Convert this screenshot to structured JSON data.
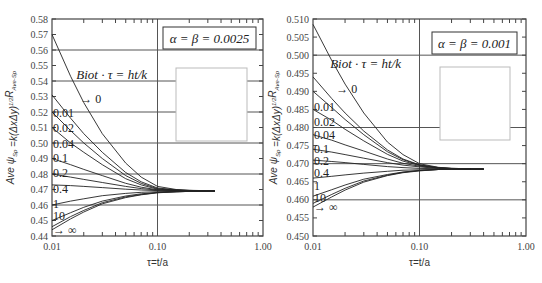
{
  "chart_data": [
    {
      "type": "line",
      "id": "left",
      "annotation_box": "α = β = 0.0025",
      "legend_title": "Biot·τ = ht/k",
      "xlabel": "τ=t/a",
      "ylabel": "Ave ψSp=k(ΔxΔy)^1/2 RAve-Sp",
      "xscale": "log",
      "xlim": [
        0.01,
        1.0
      ],
      "ylim": [
        0.44,
        0.58
      ],
      "xticks": [
        "0.01",
        "0.10",
        "1.00"
      ],
      "yticks": [
        "0.44",
        "0.45",
        "0.46",
        "0.47",
        "0.48",
        "0.49",
        "0.50",
        "0.51",
        "0.52",
        "0.53",
        "0.54",
        "0.55",
        "0.56",
        "0.57",
        "0.58"
      ],
      "grid_y": [
        0.46,
        0.48,
        0.5,
        0.52,
        0.54,
        0.56
      ],
      "grid_x": [
        0.1
      ],
      "converge_value": 0.469,
      "x": [
        0.01,
        0.015,
        0.02,
        0.03,
        0.05,
        0.07,
        0.1,
        0.15,
        0.2,
        0.3,
        0.35
      ],
      "series": [
        {
          "name": "0",
          "label": "→ 0",
          "values": [
            0.57,
            0.543,
            0.526,
            0.506,
            0.487,
            0.478,
            0.472,
            0.47,
            0.4695,
            0.4692,
            0.469
          ]
        },
        {
          "name": "0.01",
          "label": "0.01",
          "values": [
            0.531,
            0.516,
            0.506,
            0.494,
            0.481,
            0.475,
            0.471,
            0.4698,
            0.4694,
            0.4691,
            0.469
          ]
        },
        {
          "name": "0.02",
          "label": "0.02",
          "values": [
            0.52,
            0.508,
            0.5,
            0.49,
            0.479,
            0.474,
            0.4705,
            0.4696,
            0.4693,
            0.4691,
            0.469
          ]
        },
        {
          "name": "0.04",
          "label": "0.04",
          "values": [
            0.51,
            0.5,
            0.494,
            0.486,
            0.477,
            0.473,
            0.4702,
            0.4695,
            0.4692,
            0.4691,
            0.469
          ]
        },
        {
          "name": "0.1",
          "label": "0.1",
          "values": [
            0.49,
            0.486,
            0.483,
            0.479,
            0.474,
            0.4715,
            0.4698,
            0.4694,
            0.4692,
            0.469,
            0.469
          ]
        },
        {
          "name": "0.2",
          "label": "0.2",
          "values": [
            0.48,
            0.478,
            0.4765,
            0.4745,
            0.472,
            0.4706,
            0.4696,
            0.4693,
            0.4691,
            0.469,
            0.469
          ]
        },
        {
          "name": "0.4",
          "label": "0.4",
          "values": [
            0.473,
            0.4725,
            0.472,
            0.4712,
            0.4702,
            0.4697,
            0.4693,
            0.4691,
            0.469,
            0.469,
            0.469
          ]
        },
        {
          "name": "1",
          "label": "1",
          "values": [
            0.46,
            0.4625,
            0.464,
            0.466,
            0.4675,
            0.4682,
            0.4686,
            0.4688,
            0.4689,
            0.469,
            0.469
          ]
        },
        {
          "name": "10",
          "label": "10",
          "values": [
            0.45,
            0.455,
            0.4585,
            0.4625,
            0.4658,
            0.4672,
            0.4681,
            0.4686,
            0.4688,
            0.4689,
            0.469
          ]
        },
        {
          "name": "inf",
          "label": "→ ∞",
          "values": [
            0.446,
            0.4525,
            0.4565,
            0.4615,
            0.4652,
            0.4668,
            0.468,
            0.4685,
            0.4688,
            0.4689,
            0.469
          ]
        },
        {
          "name": "inf2",
          "label": "",
          "values": [
            0.444,
            0.451,
            0.4555,
            0.4608,
            0.4648,
            0.4666,
            0.4679,
            0.4685,
            0.4688,
            0.4689,
            0.469
          ]
        }
      ],
      "curve_labels": [
        {
          "text": "Biot · τ = ht/k",
          "x": 0.017,
          "y": 0.541,
          "italic": true
        },
        {
          "text": "→ 0",
          "x": 0.0185,
          "y": 0.526
        },
        {
          "text": "0.01",
          "x": 0.0102,
          "y": 0.517
        },
        {
          "text": "0.02",
          "x": 0.0102,
          "y": 0.507
        },
        {
          "text": "0.04",
          "x": 0.0102,
          "y": 0.497
        },
        {
          "text": "0.1",
          "x": 0.0102,
          "y": 0.488
        },
        {
          "text": "0.2",
          "x": 0.0102,
          "y": 0.478
        },
        {
          "text": "0.4",
          "x": 0.0102,
          "y": 0.468
        },
        {
          "text": "1",
          "x": 0.0102,
          "y": 0.458
        },
        {
          "text": "10",
          "x": 0.0102,
          "y": 0.4505
        },
        {
          "text": "→ ∞",
          "x": 0.0102,
          "y": 0.4415
        }
      ]
    },
    {
      "type": "line",
      "id": "right",
      "annotation_box": "α = β = 0.001",
      "legend_title": "Biot·τ = ht/k",
      "xlabel": "τ=t/a",
      "ylabel": "Ave ψSp=k(ΔxΔy)^1/2 RAve-Sp",
      "xscale": "log",
      "xlim": [
        0.01,
        1.0
      ],
      "ylim": [
        0.45,
        0.51
      ],
      "xticks": [
        "0.01",
        "0.10",
        "1.00"
      ],
      "yticks": [
        "0.450",
        "0.455",
        "0.460",
        "0.465",
        "0.470",
        "0.475",
        "0.480",
        "0.485",
        "0.490",
        "0.495",
        "0.500",
        "0.505",
        "0.510"
      ],
      "grid_y": [
        0.46,
        0.47,
        0.48,
        0.5
      ],
      "grid_x": [
        0.1
      ],
      "converge_value": 0.4685,
      "x": [
        0.01,
        0.015,
        0.02,
        0.03,
        0.05,
        0.07,
        0.1,
        0.15,
        0.2,
        0.3,
        0.4
      ],
      "series": [
        {
          "name": "0",
          "label": "→ 0",
          "values": [
            0.5085,
            0.4985,
            0.492,
            0.484,
            0.476,
            0.4725,
            0.47,
            0.469,
            0.4687,
            0.4686,
            0.4685
          ]
        },
        {
          "name": "0.01",
          "label": "0.01",
          "values": [
            0.494,
            0.488,
            0.484,
            0.479,
            0.4738,
            0.4713,
            0.4697,
            0.4689,
            0.4687,
            0.4686,
            0.4685
          ]
        },
        {
          "name": "0.02",
          "label": "0.02",
          "values": [
            0.49,
            0.4855,
            0.4822,
            0.478,
            0.4733,
            0.4711,
            0.4696,
            0.4689,
            0.4687,
            0.4686,
            0.4685
          ]
        },
        {
          "name": "0.04",
          "label": "0.04",
          "values": [
            0.485,
            0.482,
            0.4795,
            0.4763,
            0.4726,
            0.4707,
            0.4695,
            0.4688,
            0.4686,
            0.4685,
            0.4685
          ]
        },
        {
          "name": "0.1",
          "label": "0.1",
          "values": [
            0.478,
            0.4765,
            0.4752,
            0.4735,
            0.4713,
            0.4701,
            0.4693,
            0.4688,
            0.4686,
            0.4685,
            0.4685
          ]
        },
        {
          "name": "0.2",
          "label": "0.2",
          "values": [
            0.474,
            0.4732,
            0.4725,
            0.4715,
            0.4703,
            0.4696,
            0.4691,
            0.4687,
            0.4686,
            0.4685,
            0.4685
          ]
        },
        {
          "name": "0.4",
          "label": "0.4",
          "values": [
            0.471,
            0.4706,
            0.4703,
            0.4698,
            0.4692,
            0.4689,
            0.4687,
            0.4686,
            0.4685,
            0.4685,
            0.4685
          ]
        },
        {
          "name": "1",
          "label": "1",
          "values": [
            0.466,
            0.4665,
            0.4669,
            0.4674,
            0.4679,
            0.4682,
            0.4683,
            0.4684,
            0.4685,
            0.4685,
            0.4685
          ]
        },
        {
          "name": "10",
          "label": "10",
          "values": [
            0.461,
            0.4628,
            0.4641,
            0.4657,
            0.467,
            0.4677,
            0.4681,
            0.4684,
            0.4685,
            0.4685,
            0.4685
          ]
        },
        {
          "name": "inf",
          "label": "→ ∞",
          "values": [
            0.459,
            0.4615,
            0.4632,
            0.4652,
            0.4668,
            0.4676,
            0.4681,
            0.4684,
            0.4685,
            0.4685,
            0.4685
          ]
        },
        {
          "name": "inf2",
          "label": "",
          "values": [
            0.458,
            0.4608,
            0.4627,
            0.4649,
            0.4667,
            0.4675,
            0.468,
            0.4684,
            0.4685,
            0.4685,
            0.4685
          ]
        }
      ],
      "curve_labels": [
        {
          "text": "Biot · τ = ht/k",
          "x": 0.0145,
          "y": 0.4965,
          "italic": true
        },
        {
          "text": "→ 0",
          "x": 0.0165,
          "y": 0.4895
        },
        {
          "text": "0.01",
          "x": 0.0102,
          "y": 0.4845
        },
        {
          "text": "0.02",
          "x": 0.0102,
          "y": 0.4805
        },
        {
          "text": "0.04",
          "x": 0.0102,
          "y": 0.4768
        },
        {
          "text": "0.1",
          "x": 0.0102,
          "y": 0.473
        },
        {
          "text": "0.2",
          "x": 0.0102,
          "y": 0.4695
        },
        {
          "text": "0.4",
          "x": 0.0102,
          "y": 0.4662
        },
        {
          "text": "1",
          "x": 0.0102,
          "y": 0.4628
        },
        {
          "text": "10",
          "x": 0.0102,
          "y": 0.4595
        },
        {
          "text": "→ ∞",
          "x": 0.0102,
          "y": 0.4568
        }
      ]
    }
  ]
}
